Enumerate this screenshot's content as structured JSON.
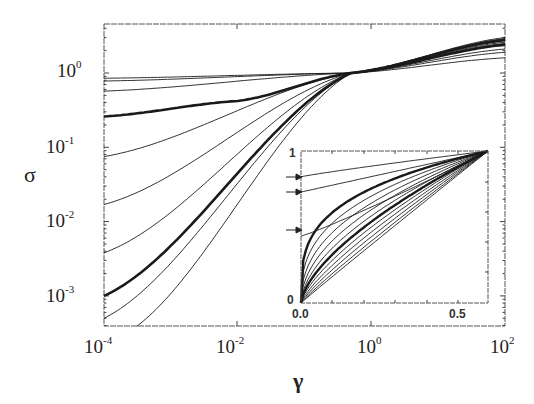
{
  "chart_data": [
    {
      "type": "line",
      "title": "",
      "xlabel": "γ",
      "ylabel": "σ",
      "xscale": "log",
      "yscale": "log",
      "xlim": [
        0.0001,
        100
      ],
      "ylim": [
        0.0003,
        4
      ],
      "x_ticks": [
        "10^-4",
        "10^-2",
        "10^0",
        "10^2"
      ],
      "y_ticks": [
        "10^-3",
        "10^-2",
        "10^-1",
        "10^0"
      ],
      "grid": false,
      "legend": null,
      "annotations": [
        "all curves cross near γ ≈ 0.5, σ ≈ 1",
        "thick curves highlight two members of the family"
      ],
      "series": [
        {
          "name": "curve-1",
          "thick": false,
          "x": [
            0.0001,
            0.5,
            100
          ],
          "y": [
            0.85,
            1.0,
            1.6
          ]
        },
        {
          "name": "curve-2",
          "thick": false,
          "x": [
            0.0001,
            0.5,
            100
          ],
          "y": [
            0.78,
            1.0,
            1.9
          ]
        },
        {
          "name": "curve-3",
          "thick": false,
          "x": [
            0.0001,
            0.5,
            100
          ],
          "y": [
            0.57,
            1.0,
            2.1
          ]
        },
        {
          "name": "curve-4",
          "thick": true,
          "x": [
            0.0001,
            0.01,
            0.5,
            100
          ],
          "y": [
            0.26,
            0.42,
            1.0,
            2.4
          ]
        },
        {
          "name": "curve-5",
          "thick": false,
          "x": [
            0.0001,
            0.5,
            100
          ],
          "y": [
            0.075,
            1.0,
            2.5
          ]
        },
        {
          "name": "curve-6",
          "thick": false,
          "x": [
            0.0001,
            0.5,
            100
          ],
          "y": [
            0.017,
            1.0,
            2.6
          ]
        },
        {
          "name": "curve-7",
          "thick": false,
          "x": [
            0.0001,
            0.5,
            100
          ],
          "y": [
            0.0038,
            1.0,
            2.7
          ]
        },
        {
          "name": "curve-8",
          "thick": true,
          "x": [
            0.0001,
            0.5,
            100
          ],
          "y": [
            0.001,
            1.0,
            2.8
          ]
        },
        {
          "name": "curve-9",
          "thick": false,
          "x": [
            0.0001,
            0.5,
            100
          ],
          "y": [
            0.0005,
            1.0,
            2.9
          ]
        },
        {
          "name": "curve-10",
          "thick": false,
          "x": [
            0.0002,
            0.5,
            100
          ],
          "y": [
            0.0003,
            1.0,
            3.0
          ]
        }
      ]
    },
    {
      "type": "line",
      "title": "inset",
      "xlabel": "",
      "ylabel": "",
      "xscale": "linear",
      "yscale": "linear",
      "xlim": [
        0.0,
        0.65
      ],
      "ylim": [
        0,
        1
      ],
      "x_ticks": [
        "0.0",
        "0.5"
      ],
      "y_ticks": [
        "0",
        "1"
      ],
      "annotations": [
        "arrows on left axis at y ≈ 0.83, 0.73, 0.44"
      ],
      "arrow_marks_y": [
        0.83,
        0.73,
        0.44
      ],
      "series_count": 14
    }
  ],
  "axes": {
    "x_title": "γ",
    "y_title": "σ",
    "x_tick_labels": [
      {
        "base": "10",
        "exp": "-4"
      },
      {
        "base": "10",
        "exp": "-2"
      },
      {
        "base": "10",
        "exp": "0"
      },
      {
        "base": "10",
        "exp": "2"
      }
    ],
    "y_tick_labels": [
      {
        "base": "10",
        "exp": "0"
      },
      {
        "base": "10",
        "exp": "-1"
      },
      {
        "base": "10",
        "exp": "-2"
      },
      {
        "base": "10",
        "exp": "-3"
      }
    ]
  },
  "inset": {
    "x_tick_labels": [
      "0.0",
      "0.5"
    ],
    "y_tick_labels": [
      "1",
      "0"
    ]
  },
  "colors": {
    "line": "#1a1a1a",
    "axis": "#444444",
    "background": "#ffffff"
  }
}
